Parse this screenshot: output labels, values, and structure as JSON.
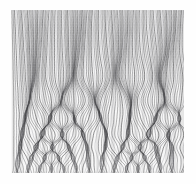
{
  "artwork": {
    "title": "Concentric Wave Interference Field",
    "kind": "generative-line-pattern",
    "medium": "fine line engraving",
    "palette": {
      "page": "#ffffff",
      "plate_base": "#f7f7f7",
      "line_dark": "#262628",
      "line_mid": "#55565a",
      "line_light": "#9a9ba0",
      "average_tone": "#8b8c90"
    },
    "canvas": {
      "width": 196,
      "height": 184
    },
    "plate": {
      "x": 11,
      "y": 10,
      "width": 173,
      "height": 163
    },
    "structure": {
      "description": "Dense field of thin near-vertical lines that bulge into horizontal rows of nested ellipses toward the bottom, producing moire interference.",
      "line_count": 150,
      "line_spacing_px": 1.15,
      "stroke_width_px": 0.55,
      "top_region": "straight vertical lines with slow lateral wave",
      "middle_region": "wide soft lens / ogive bulges",
      "bottom_region": "tight rows of nested concentric ellipses"
    },
    "bands": [
      {
        "index": 0,
        "center_y": 24,
        "amplitude": 2.0,
        "period": 46,
        "label": "band-1-faint-wave"
      },
      {
        "index": 1,
        "center_y": 52,
        "amplitude": 3.2,
        "period": 44,
        "label": "band-2-wave"
      },
      {
        "index": 2,
        "center_y": 78,
        "amplitude": 4.6,
        "period": 42,
        "label": "band-3-lens"
      },
      {
        "index": 3,
        "center_y": 100,
        "amplitude": 5.6,
        "period": 34,
        "label": "band-4-lens"
      },
      {
        "index": 4,
        "center_y": 118,
        "amplitude": 6.2,
        "period": 26,
        "label": "band-5-ellipse-row"
      },
      {
        "index": 5,
        "center_y": 134,
        "amplitude": 6.0,
        "period": 21,
        "label": "band-6-ellipse-row"
      },
      {
        "index": 6,
        "center_y": 147,
        "amplitude": 5.4,
        "period": 17,
        "label": "band-7-ellipse-row"
      },
      {
        "index": 7,
        "center_y": 158,
        "amplitude": 4.8,
        "period": 14,
        "label": "band-8-ellipse-row"
      },
      {
        "index": 8,
        "center_y": 167,
        "amplitude": 4.0,
        "period": 12,
        "label": "band-9-ellipse-row"
      }
    ]
  }
}
